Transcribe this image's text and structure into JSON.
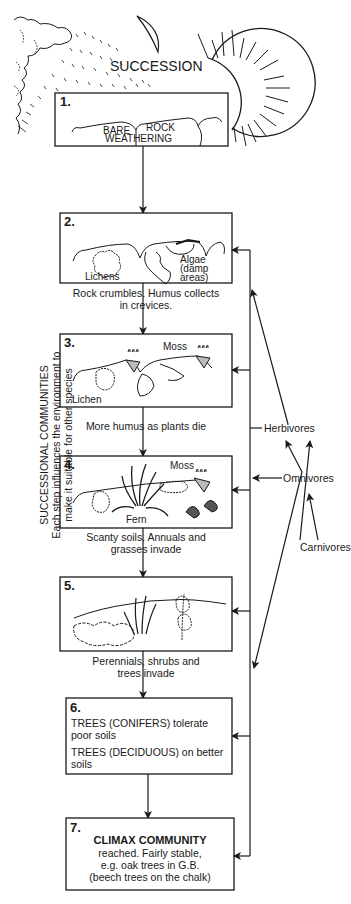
{
  "title": "SUCCESSION",
  "side_label": {
    "heading": "SUCCESSIONAL COMMUNITIES",
    "line1": "Each step influences the environment to",
    "line2": "make it suitable for other species"
  },
  "steps": [
    {
      "number": "1.",
      "labels": [
        "BARE",
        "ROCK",
        "WEATHERING"
      ]
    },
    {
      "number": "2.",
      "labels": [
        "Lichens",
        "Algae",
        "(damp",
        "areas)"
      ],
      "caption": [
        "Rock crumbles. Humus collects",
        "in crevices."
      ]
    },
    {
      "number": "3.",
      "labels": [
        "Moss",
        "Lichen"
      ],
      "caption": [
        "More humus as plants die"
      ]
    },
    {
      "number": "4.",
      "labels": [
        "Moss",
        "Fern"
      ],
      "caption": [
        "Scanty soils. Annuals and",
        "grasses invade"
      ]
    },
    {
      "number": "5.",
      "labels": [],
      "caption": [
        "Perennials, shrubs and",
        "trees invade"
      ]
    },
    {
      "number": "6.",
      "lines": [
        "TREES (CONIFERS) tolerate",
        "poor soils",
        "TREES (DECIDUOUS) on better",
        "soils"
      ]
    },
    {
      "number": "7.",
      "heading": "CLIMAX COMMUNITY",
      "lines": [
        "reached. Fairly stable,",
        "e.g. oak trees in G.B.",
        "(beech trees on the chalk)"
      ]
    }
  ],
  "consumers": {
    "herbivores": "Herbivores",
    "omnivores": "Omnivores",
    "carnivores": "Carnivores"
  }
}
